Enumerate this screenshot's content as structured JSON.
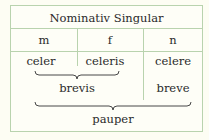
{
  "table": {
    "title": "Nominativ Singular",
    "genders": [
      "m",
      "f",
      "n"
    ],
    "forms": [
      "celer",
      "celeris",
      "celere"
    ],
    "groups": {
      "brevis": "brevis",
      "breve": "breve",
      "pauper": "pauper"
    }
  },
  "colors": {
    "border": "#b9d3ae",
    "background": "#fefef7"
  }
}
